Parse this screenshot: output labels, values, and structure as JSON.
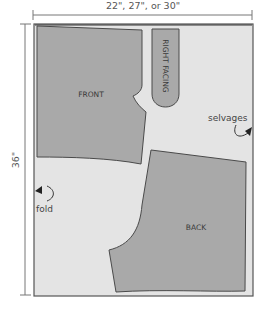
{
  "diagram": {
    "type": "sewing-pattern-layout",
    "width_label": "22\", 27\", or 30\"",
    "length_label": "36\"",
    "colors": {
      "fabric": "#e4e4e4",
      "fabric_edge": "#555555",
      "piece": "#a9a9a9",
      "piece_edge": "#4a4a4a",
      "dimension_line": "#777777"
    },
    "pieces": [
      {
        "id": "front",
        "label": "FRONT"
      },
      {
        "id": "right-facing",
        "label": "RIGHT FACING"
      },
      {
        "id": "back",
        "label": "BACK"
      }
    ],
    "annotations": [
      {
        "id": "selvages",
        "label": "selvages"
      },
      {
        "id": "fold",
        "label": "fold"
      }
    ]
  }
}
